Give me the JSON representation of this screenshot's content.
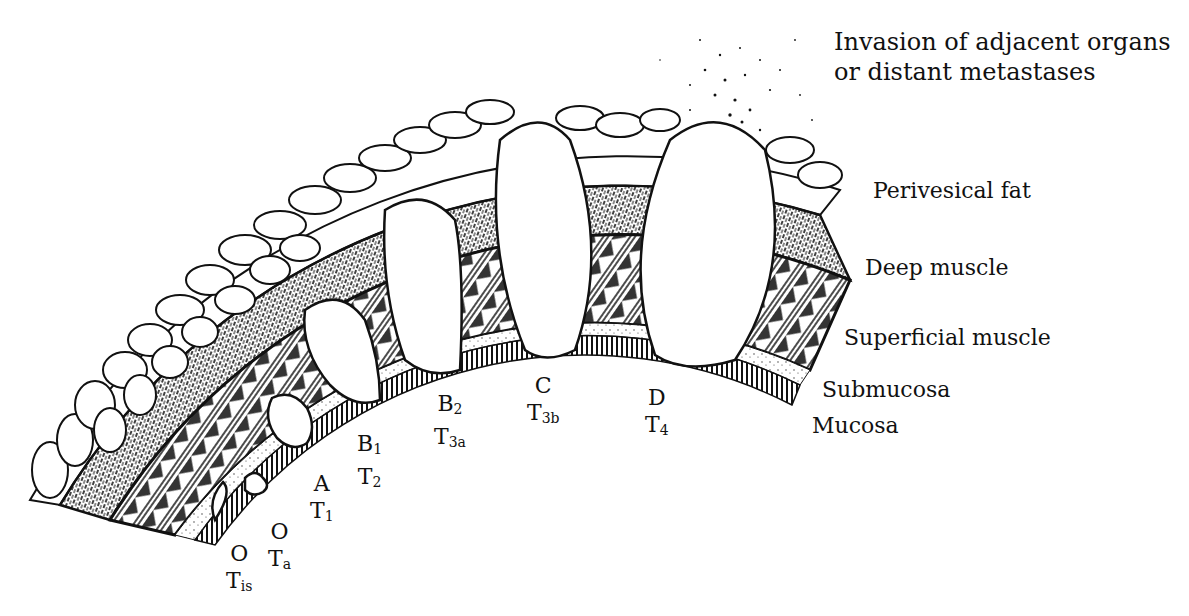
{
  "colors": {
    "ink": "#111111",
    "background": "#ffffff"
  },
  "layer_labels": [
    {
      "id": "invasion",
      "text_line1": "Invasion of adjacent organs",
      "text_line2": "or distant metastases"
    },
    {
      "id": "perivesical-fat",
      "text": "Perivesical fat"
    },
    {
      "id": "deep-muscle",
      "text": "Deep muscle"
    },
    {
      "id": "superficial-muscle",
      "text": "Superficial muscle"
    },
    {
      "id": "submucosa",
      "text": "Submucosa"
    },
    {
      "id": "mucosa",
      "text": "Mucosa"
    }
  ],
  "stages": [
    {
      "id": "O-Tis",
      "jewett": "O",
      "tnm": "T",
      "tnm_sub": "is"
    },
    {
      "id": "O-Ta",
      "jewett": "O",
      "tnm": "T",
      "tnm_sub": "a"
    },
    {
      "id": "A-T1",
      "jewett": "A",
      "tnm": "T",
      "tnm_sub": "1"
    },
    {
      "id": "B1-T2",
      "jewett": "B",
      "jewett_sub": "1",
      "tnm": "T",
      "tnm_sub": "2"
    },
    {
      "id": "B2-T3a",
      "jewett": "B",
      "jewett_sub": "2",
      "tnm": "T",
      "tnm_sub": "3a"
    },
    {
      "id": "C-T3b",
      "jewett": "C",
      "tnm": "T",
      "tnm_sub": "3b"
    },
    {
      "id": "D-T4",
      "jewett": "D",
      "tnm": "T",
      "tnm_sub": "4"
    }
  ]
}
